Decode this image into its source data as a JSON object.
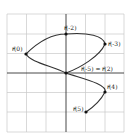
{
  "diagram": {
    "type": "parametric-curve-on-grid",
    "grid": {
      "cells_x": 6,
      "cells_y": 6,
      "x_range": [
        -3,
        3
      ],
      "y_range": [
        -3,
        3
      ]
    },
    "points": [
      {
        "id": "r0",
        "label": "r⃗(0)",
        "x": -2,
        "y": 1
      },
      {
        "id": "rm2",
        "label": "r⃗(-2)",
        "x": 0,
        "y": 2
      },
      {
        "id": "rm3",
        "label": "r⃗(-3)",
        "x": 2,
        "y": 1.5
      },
      {
        "id": "rm5",
        "label": "r⃗(-5) = r⃗(2)",
        "x": 0,
        "y": 0
      },
      {
        "id": "r4",
        "label": "r⃗(4)",
        "x": 2,
        "y": -1
      },
      {
        "id": "r5",
        "label": "r⃗(5)",
        "x": 1,
        "y": -2
      }
    ],
    "colors": {
      "grid": "#c8c8c8",
      "axis": "#333333",
      "curve": "#333333",
      "point": "#111111"
    }
  }
}
